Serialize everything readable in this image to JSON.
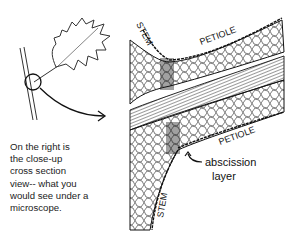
{
  "caption": {
    "lines": [
      "On the right is",
      "the close-up",
      "cross section",
      "view-- what you",
      "would see under a",
      "microscope."
    ]
  },
  "labels": {
    "stem_top": "STEM",
    "petiole_top": "PETIOLE",
    "petiole_bottom": "PETIOLE",
    "stem_bottom": "STEM",
    "abscission_line1": "abscission",
    "abscission_line2": "layer"
  },
  "colors": {
    "ink": "#111111",
    "background": "#ffffff"
  }
}
